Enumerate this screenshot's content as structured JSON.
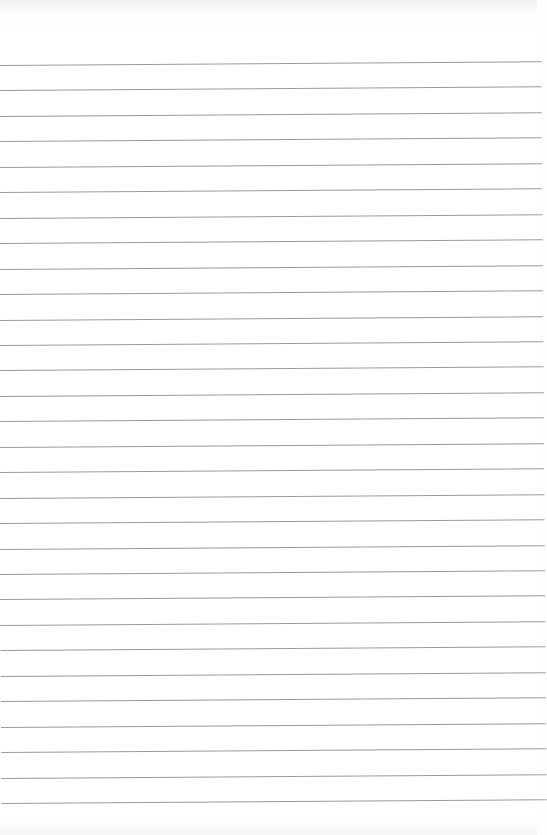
{
  "paper": {
    "type": "lined-paper",
    "line_count": 30,
    "first_line_y": 65,
    "line_spacing": 25.45,
    "line_color": "#8a8a8a",
    "background_color": "#ffffff"
  }
}
